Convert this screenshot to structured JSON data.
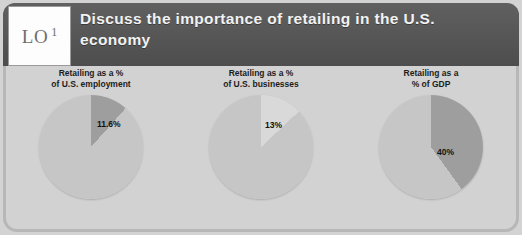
{
  "slide": {
    "lo_marker": {
      "prefix": "LO",
      "number": "1"
    },
    "title": "Discuss the importance of retailing in the U.S. economy"
  },
  "colors": {
    "header_band": "#565656",
    "slide_background": "#d2d2d2",
    "frame_border": "#b7b7b7",
    "pie_base": "#c6c6c6",
    "pie_slice_dark": "#9e9e9e",
    "pie_slice_light": "#d9d9d9",
    "title_text": "#f2f2f2",
    "caption_text": "#1c1c1c"
  },
  "chart_data": [
    {
      "type": "pie",
      "title": "Retailing as a %\nof U.S. employment",
      "categories": [
        "Retailing",
        "Other"
      ],
      "values": [
        11.6,
        88.4
      ],
      "labels": [
        "11.6%",
        ""
      ],
      "slice_colors": [
        "#9e9e9e",
        "#c6c6c6"
      ],
      "start_angle": 0,
      "label_position": {
        "left": "58px",
        "top": "24px"
      }
    },
    {
      "type": "pie",
      "title": "Retailing as a %\nof U.S. businesses",
      "categories": [
        "Retailing",
        "Other"
      ],
      "values": [
        13,
        87
      ],
      "labels": [
        "13%",
        ""
      ],
      "slice_colors": [
        "#d9d9d9",
        "#c6c6c6"
      ],
      "start_angle": 0,
      "label_position": {
        "left": "56px",
        "top": "25px"
      }
    },
    {
      "type": "pie",
      "title": "Retailing as a\n% of GDP",
      "categories": [
        "Retailing",
        "Other"
      ],
      "values": [
        40,
        60
      ],
      "labels": [
        "40%",
        ""
      ],
      "slice_colors": [
        "#9e9e9e",
        "#c6c6c6"
      ],
      "start_angle": 0,
      "label_position": {
        "left": "58px",
        "top": "52px"
      }
    }
  ]
}
